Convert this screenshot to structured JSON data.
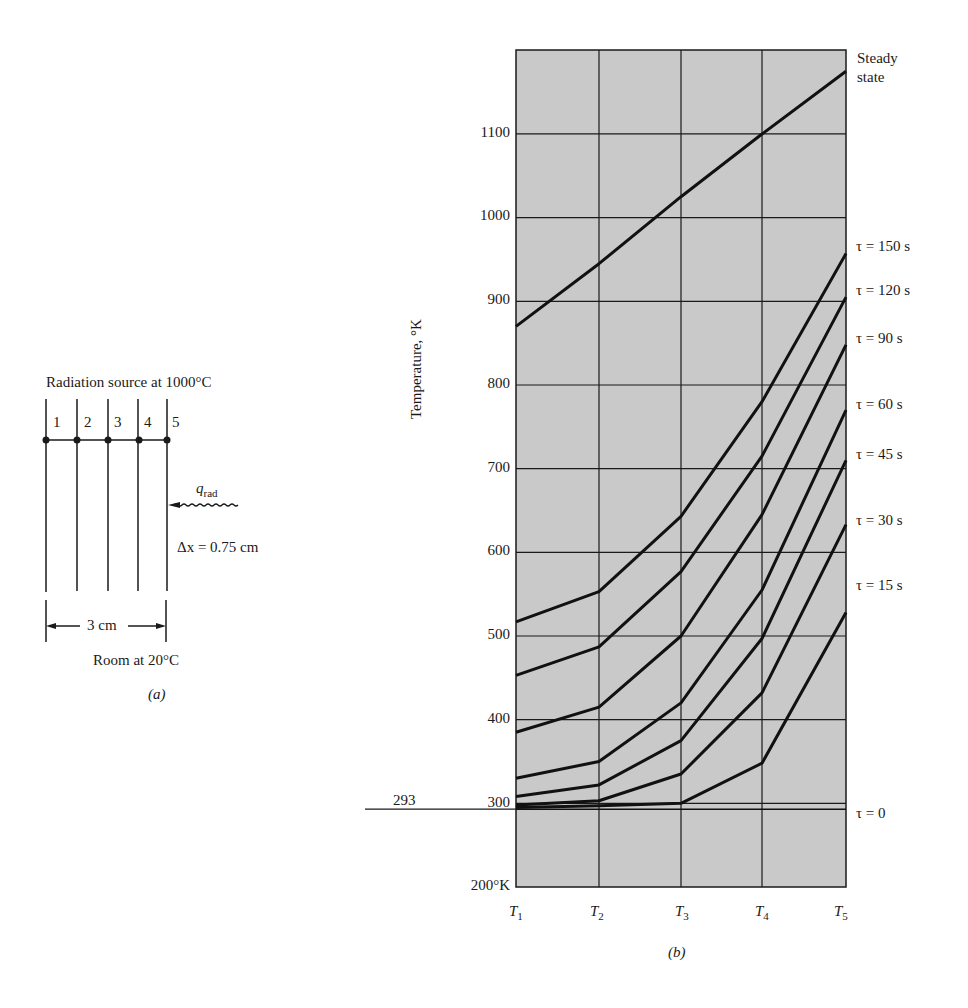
{
  "diagram_a": {
    "title": "Radiation source at 1000°C",
    "node_labels": [
      "1",
      "2",
      "3",
      "4",
      "5"
    ],
    "flux_label": "q",
    "flux_subscript": "rad",
    "spacing_label": "Δx = 0.75 cm",
    "width_label": "3 cm",
    "bottom_label": "Room at 20°C",
    "caption": "(a)"
  },
  "chart_b": {
    "caption": "(b)",
    "ylabel": "Temperature, °K",
    "y_ticks": [
      "1100",
      "1000",
      "900",
      "800",
      "700",
      "600",
      "500",
      "400",
      "300",
      "200°K"
    ],
    "ref_label": "293",
    "x_ticks": [
      "T",
      "T",
      "T",
      "T",
      "T"
    ],
    "x_subs": [
      "1",
      "2",
      "3",
      "4",
      "5"
    ],
    "curve_labels": {
      "steady": "Steady state",
      "steady_l1": "Steady",
      "steady_l2": "state",
      "t150": "τ = 150 s",
      "t120": "τ = 120 s",
      "t90": "τ = 90 s",
      "t60": "τ = 60 s",
      "t45": "τ = 45 s",
      "t30": "τ = 30 s",
      "t15": "τ = 15 s",
      "t0": "τ = 0"
    },
    "colors": {
      "plot_bg": "#c9c9c9",
      "grid": "#1a1a1a",
      "line": "#111111"
    }
  },
  "chart_data": {
    "type": "line",
    "title": "",
    "xlabel": "",
    "ylabel": "Temperature, °K",
    "categories": [
      "T1",
      "T2",
      "T3",
      "T4",
      "T5"
    ],
    "ylim": [
      200,
      1200
    ],
    "y_ticks": [
      200,
      300,
      400,
      500,
      600,
      700,
      800,
      900,
      1000,
      1100
    ],
    "grid": true,
    "reference_line": {
      "value": 293,
      "label": "293"
    },
    "series": [
      {
        "name": "Steady state",
        "values": [
          870,
          945,
          1025,
          1100,
          1175
        ]
      },
      {
        "name": "τ = 150 s",
        "values": [
          517,
          553,
          643,
          780,
          957
        ]
      },
      {
        "name": "τ = 120 s",
        "values": [
          453,
          487,
          577,
          715,
          905
        ]
      },
      {
        "name": "τ = 90 s",
        "values": [
          385,
          415,
          500,
          645,
          848
        ]
      },
      {
        "name": "τ = 60 s",
        "values": [
          330,
          350,
          420,
          555,
          770
        ]
      },
      {
        "name": "τ = 45 s",
        "values": [
          308,
          322,
          375,
          497,
          710
        ]
      },
      {
        "name": "τ = 30 s",
        "values": [
          298,
          303,
          335,
          432,
          633
        ]
      },
      {
        "name": "τ = 15 s",
        "values": [
          295,
          297,
          300,
          348,
          528
        ]
      },
      {
        "name": "τ = 0",
        "values": [
          293,
          293,
          293,
          293,
          293
        ]
      }
    ],
    "legend_position": "right (inline labels)"
  }
}
